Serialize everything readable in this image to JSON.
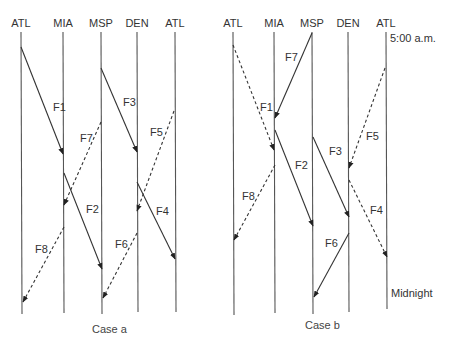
{
  "diagram": {
    "type": "time-space flight rotation diagram",
    "case_a": {
      "caption": "Case a",
      "stations": [
        {
          "label": "ATL",
          "x": 21
        },
        {
          "label": "MIA",
          "x": 63
        },
        {
          "label": "MSP",
          "x": 101
        },
        {
          "label": "DEN",
          "x": 137
        },
        {
          "label": "ATL",
          "x": 175
        }
      ],
      "flights": [
        {
          "label": "F1",
          "style": "solid",
          "from": [
            21,
            47
          ],
          "to": [
            63,
            154
          ],
          "label_pos": [
            53,
            111
          ]
        },
        {
          "label": "F7",
          "style": "dashed",
          "from": [
            101,
            122
          ],
          "to": [
            64,
            205
          ],
          "label_pos": [
            80,
            142
          ]
        },
        {
          "label": "F3",
          "style": "solid",
          "from": [
            101,
            68
          ],
          "to": [
            137,
            152
          ],
          "label_pos": [
            123,
            106
          ]
        },
        {
          "label": "F5",
          "style": "dashed",
          "from": [
            174,
            111
          ],
          "to": [
            137,
            211
          ],
          "label_pos": [
            150,
            136
          ]
        },
        {
          "label": "F2",
          "style": "solid",
          "from": [
            64,
            173
          ],
          "to": [
            102,
            269
          ],
          "label_pos": [
            86,
            213
          ]
        },
        {
          "label": "F4",
          "style": "solid",
          "from": [
            137,
            182
          ],
          "to": [
            175,
            259
          ],
          "label_pos": [
            156,
            215
          ]
        },
        {
          "label": "F8",
          "style": "dashed",
          "from": [
            64,
            227
          ],
          "to": [
            23,
            302
          ],
          "label_pos": [
            35,
            253
          ]
        },
        {
          "label": "F6",
          "style": "dashed",
          "from": [
            137,
            233
          ],
          "to": [
            103,
            298
          ],
          "label_pos": [
            115,
            248
          ]
        }
      ]
    },
    "case_b": {
      "caption": "Case b",
      "start_time": "5:00 a.m.",
      "end_time": "Midnight",
      "stations": [
        {
          "label": "ATL",
          "x": 233
        },
        {
          "label": "MIA",
          "x": 274
        },
        {
          "label": "MSP",
          "x": 312
        },
        {
          "label": "DEN",
          "x": 348
        },
        {
          "label": "ATL",
          "x": 386
        }
      ],
      "flights": [
        {
          "label": "F7",
          "style": "solid",
          "from": [
            312,
            33
          ],
          "to": [
            275,
            118
          ],
          "label_pos": [
            285,
            61
          ]
        },
        {
          "label": "F1",
          "style": "dashed",
          "from": [
            233,
            45
          ],
          "to": [
            274,
            150
          ],
          "label_pos": [
            260,
            111
          ]
        },
        {
          "label": "F2",
          "style": "solid",
          "from": [
            275,
            130
          ],
          "to": [
            313,
            226
          ],
          "label_pos": [
            295,
            169
          ]
        },
        {
          "label": "F3",
          "style": "solid",
          "from": [
            313,
            137
          ],
          "to": [
            349,
            217
          ],
          "label_pos": [
            329,
            155
          ]
        },
        {
          "label": "F5",
          "style": "dashed",
          "from": [
            385,
            68
          ],
          "to": [
            349,
            168
          ],
          "label_pos": [
            366,
            140
          ]
        },
        {
          "label": "F8",
          "style": "dashed",
          "from": [
            275,
            165
          ],
          "to": [
            234,
            240
          ],
          "label_pos": [
            242,
            200
          ]
        },
        {
          "label": "F4",
          "style": "dashed",
          "from": [
            349,
            180
          ],
          "to": [
            387,
            257
          ],
          "label_pos": [
            370,
            214
          ]
        },
        {
          "label": "F6",
          "style": "solid",
          "from": [
            349,
            233
          ],
          "to": [
            314,
            297
          ],
          "label_pos": [
            325,
            247
          ]
        }
      ]
    }
  }
}
